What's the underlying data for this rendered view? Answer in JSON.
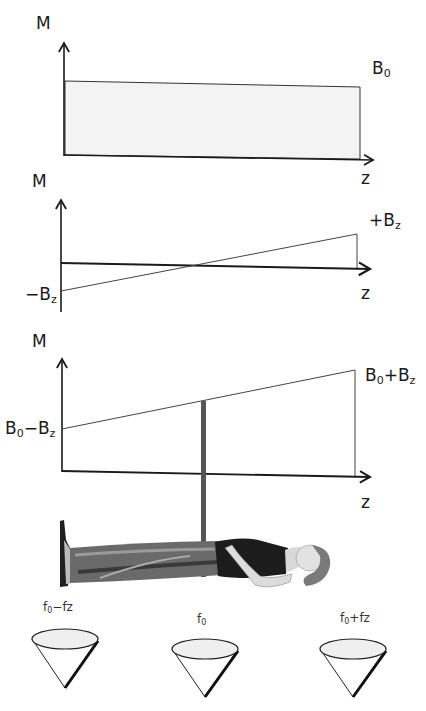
{
  "panels": [
    {
      "id": "uniform-field",
      "y_axis_label": "M",
      "x_axis_label": "z",
      "field_label": {
        "base": "B",
        "sub": "0",
        "rest": ""
      },
      "description": "Uniform main magnetic field B0 along z"
    },
    {
      "id": "gradient-field",
      "y_axis_label": "M",
      "x_axis_label": "z",
      "positive_label": {
        "prefix": "+B",
        "sub": "z"
      },
      "negative_label": {
        "prefix": "−B",
        "sub": "z"
      },
      "description": "Linear gradient field from -Bz to +Bz"
    },
    {
      "id": "combined-field",
      "y_axis_label": "M",
      "x_axis_label": "z",
      "left_label": {
        "a": "B",
        "a_sub": "0",
        "op": "−",
        "b": "B",
        "b_sub": "z"
      },
      "right_label": {
        "a": "B",
        "a_sub": "0",
        "op": "+",
        "b": "B",
        "b_sub": "z"
      },
      "description": "Combined field B0 + gradient"
    }
  ],
  "cones": [
    {
      "label": {
        "a": "f",
        "a_sub": "0",
        "rest": "−fz"
      }
    },
    {
      "label": {
        "a": "f",
        "a_sub": "0",
        "rest": ""
      }
    },
    {
      "label": {
        "a": "f",
        "a_sub": "0",
        "rest": "+fz"
      }
    }
  ],
  "colors": {
    "line": "#1a1a1a",
    "thin_line": "#444444",
    "rect_fill": "#f3f3f3",
    "slice_bar": "#555555",
    "cone_fill": "#eeeeee"
  }
}
